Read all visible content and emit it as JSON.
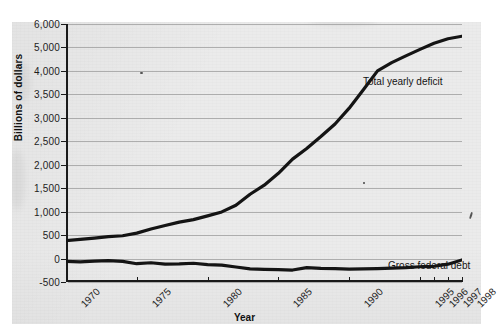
{
  "figure": {
    "media": "scanned-textbook-page",
    "background_color": "#ebebeb",
    "ink_color": "#141414"
  },
  "chart_data": {
    "type": "line",
    "title": "",
    "xlabel": "Year",
    "ylabel": "Billions of dollars",
    "grid": true,
    "legend_position": "inline-annotations",
    "x_tick_labels": [
      "1970",
      "1975",
      "1980",
      "1985",
      "1990",
      "1995",
      "1996",
      "1997",
      "1998"
    ],
    "y_tick_labels": [
      "6,000",
      "5,000",
      "4,000",
      "3,500",
      "3,000",
      "2,500",
      "2,000",
      "1,500",
      "1,000",
      "500",
      "0",
      "-500"
    ],
    "y_tick_values": [
      6000,
      5000,
      4000,
      3500,
      3000,
      2500,
      2000,
      1500,
      1000,
      500,
      0,
      -500
    ],
    "ylim": [
      -500,
      6000
    ],
    "x": [
      1970,
      1971,
      1972,
      1973,
      1974,
      1975,
      1976,
      1977,
      1978,
      1979,
      1980,
      1981,
      1982,
      1983,
      1984,
      1985,
      1986,
      1987,
      1988,
      1989,
      1990,
      1991,
      1992,
      1993,
      1994,
      1995,
      1996,
      1997,
      1998
    ],
    "series": [
      {
        "name": "Total yearly deficit",
        "color": "#141414",
        "values": [
          380,
          408,
          437,
          468,
          486,
          542,
          629,
          706,
          777,
          829,
          909,
          994,
          1137,
          1371,
          1564,
          1817,
          2120,
          2346,
          2601,
          2868,
          3206,
          3598,
          4001,
          4351,
          4643,
          4920,
          5180,
          5370,
          5480
        ]
      },
      {
        "name": "Gross federal debt",
        "color": "#141414",
        "values": [
          -60,
          -70,
          -55,
          -45,
          -60,
          -110,
          -90,
          -120,
          -115,
          -100,
          -130,
          -140,
          -180,
          -220,
          -230,
          -235,
          -245,
          -195,
          -210,
          -215,
          -225,
          -220,
          -215,
          -205,
          -195,
          -175,
          -165,
          -120,
          -30
        ]
      }
    ],
    "annotations": [
      {
        "text": "Total yearly deficit",
        "series": "Total yearly deficit"
      },
      {
        "text": "Gross federal debt",
        "series": "Gross federal debt"
      }
    ]
  }
}
